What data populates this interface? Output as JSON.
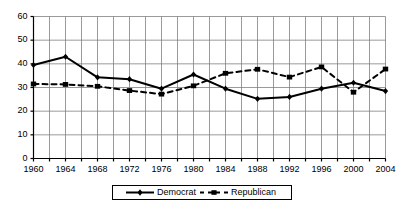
{
  "chart_data": {
    "type": "line",
    "title": "",
    "xlabel": "",
    "ylabel": "",
    "categories": [
      "1960",
      "1964",
      "1968",
      "1972",
      "1976",
      "1980",
      "1984",
      "1988",
      "1992",
      "1996",
      "2000",
      "2004"
    ],
    "x": [
      1960,
      1964,
      1968,
      1972,
      1976,
      1980,
      1984,
      1988,
      1992,
      1996,
      2000,
      2004
    ],
    "xlim": [
      1960,
      2004
    ],
    "ylim": [
      0,
      60
    ],
    "yticks": [
      0,
      10,
      20,
      30,
      40,
      50,
      60
    ],
    "ytick_labels": [
      "0",
      "10",
      "20",
      "30",
      "40",
      "50",
      "60"
    ],
    "xtick_labels": [
      "1960",
      "1964",
      "1968",
      "1972",
      "1976",
      "1980",
      "1984",
      "1988",
      "1992",
      "1996",
      "2000",
      "2004"
    ],
    "grid": true,
    "grid_axis": "both",
    "minor_grid_x_step": 2,
    "legend_position": "bottom-center",
    "series": [
      {
        "name": "Democrat",
        "style": "solid",
        "marker": "diamond",
        "color": "#000000",
        "values": [
          39.5,
          43.0,
          34.3,
          33.5,
          29.5,
          35.5,
          29.5,
          25.2,
          26.0,
          29.5,
          32.0,
          28.5
        ]
      },
      {
        "name": "Republican",
        "style": "dashed",
        "marker": "square",
        "color": "#000000",
        "values": [
          31.5,
          31.3,
          30.5,
          28.7,
          27.2,
          30.7,
          36.0,
          37.7,
          34.4,
          38.7,
          28.0,
          37.8
        ]
      }
    ]
  },
  "legend": {
    "items": [
      {
        "label": "Democrat",
        "key": "solid-line-diamond-marker"
      },
      {
        "label": "Republican",
        "key": "dashed-line-square-marker"
      }
    ]
  },
  "colors": {
    "axis": "#000000",
    "grid": "#808080",
    "series_democrat": "#000000",
    "series_republican": "#000000",
    "background": "#ffffff"
  }
}
